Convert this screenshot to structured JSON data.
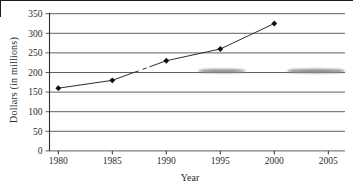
{
  "chart_data": {
    "type": "line",
    "x": [
      1980,
      1985,
      1990,
      1995,
      2000
    ],
    "y": [
      160,
      180,
      230,
      260,
      325
    ],
    "series_name": "dollars-over-years",
    "title": "",
    "xlabel": "Year",
    "ylabel": "Dollars (in millions)",
    "x_ticks": [
      1980,
      1985,
      1990,
      1995,
      2000,
      2005
    ],
    "y_ticks": [
      0,
      50,
      100,
      150,
      200,
      250,
      300,
      350
    ],
    "xlim": [
      1980,
      2005
    ],
    "ylim": [
      0,
      350
    ],
    "grid": "horizontal",
    "legend": "none",
    "marker": "diamond",
    "line_color": "#2e2e2e",
    "marker_color": "#101010",
    "text_color": "#2b2b2b",
    "gridline_color": "#4d4d4d",
    "axis_color": "#2f2f2f",
    "background": "#ffffff"
  }
}
